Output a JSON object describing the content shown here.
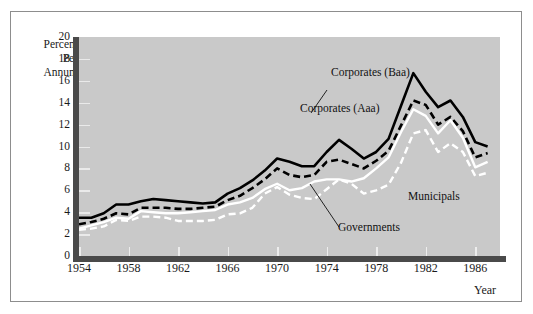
{
  "figure": {
    "background": "#ffffff",
    "plot_background": "#c9c9c9",
    "axis_color": "#4a4a4a",
    "frame_color": "#8d8d8d"
  },
  "axis_title_lines": [
    "Percent",
    "Per",
    "Annum"
  ],
  "xaxis_title": "Year",
  "annotations": {
    "corporates_baa": "Corporates (Baa)",
    "corporates_aaa": "Corporates (Aaa)",
    "municipals": "Municipals",
    "governments": "Governments"
  },
  "chart_data": {
    "type": "line",
    "title": "",
    "xlabel": "Year",
    "ylabel": "Percent Per Annum",
    "xlim": [
      1954,
      1988
    ],
    "ylim": [
      0,
      20
    ],
    "ytick_step": 2,
    "yticks": [
      0,
      2,
      4,
      6,
      8,
      10,
      12,
      14,
      16,
      18,
      20
    ],
    "xticks": [
      1954,
      1958,
      1962,
      1966,
      1970,
      1974,
      1978,
      1982,
      1986
    ],
    "grid": true,
    "legend_position": "inline-annotations",
    "x": [
      1954,
      1955,
      1956,
      1957,
      1958,
      1959,
      1960,
      1961,
      1962,
      1963,
      1964,
      1965,
      1966,
      1967,
      1968,
      1969,
      1970,
      1971,
      1972,
      1973,
      1974,
      1975,
      1976,
      1977,
      1978,
      1979,
      1980,
      1981,
      1982,
      1983,
      1984,
      1985,
      1986,
      1987
    ],
    "series": [
      {
        "name": "Corporates (Baa)",
        "style": "solid",
        "color": "#000000",
        "values": [
          3.5,
          3.5,
          3.9,
          4.7,
          4.7,
          5.0,
          5.2,
          5.1,
          5.0,
          4.9,
          4.8,
          4.9,
          5.7,
          6.2,
          6.9,
          7.8,
          8.9,
          8.6,
          8.2,
          8.2,
          9.5,
          10.6,
          9.8,
          8.9,
          9.5,
          10.7,
          13.7,
          16.7,
          15.0,
          13.6,
          14.2,
          12.7,
          10.4,
          10.0
        ]
      },
      {
        "name": "Corporates (Aaa)",
        "style": "dashed",
        "color": "#000000",
        "values": [
          2.9,
          3.1,
          3.4,
          3.9,
          3.8,
          4.4,
          4.4,
          4.4,
          4.3,
          4.3,
          4.4,
          4.5,
          5.1,
          5.5,
          6.2,
          7.0,
          8.0,
          7.4,
          7.2,
          7.4,
          8.6,
          8.8,
          8.4,
          8.0,
          8.7,
          9.6,
          11.9,
          14.2,
          13.8,
          12.0,
          12.7,
          11.4,
          9.0,
          9.4
        ]
      },
      {
        "name": "Governments",
        "style": "solid",
        "color": "#ffffff",
        "values": [
          2.5,
          2.8,
          3.1,
          3.5,
          3.4,
          4.1,
          4.0,
          3.9,
          3.9,
          4.0,
          4.1,
          4.2,
          4.7,
          4.9,
          5.3,
          6.1,
          6.6,
          6.0,
          6.2,
          6.8,
          7.0,
          7.0,
          6.8,
          7.1,
          8.0,
          9.0,
          11.3,
          13.4,
          12.8,
          11.2,
          12.4,
          10.8,
          8.1,
          8.6
        ]
      },
      {
        "name": "Municipals",
        "style": "dashed",
        "color": "#ffffff",
        "values": [
          2.4,
          2.5,
          2.7,
          3.3,
          3.2,
          3.6,
          3.6,
          3.5,
          3.2,
          3.2,
          3.2,
          3.3,
          3.8,
          3.9,
          4.4,
          5.7,
          6.3,
          5.6,
          5.3,
          5.2,
          6.1,
          7.0,
          6.6,
          5.7,
          6.0,
          6.5,
          8.5,
          11.2,
          11.5,
          9.5,
          10.3,
          9.5,
          7.3,
          7.6
        ]
      }
    ]
  }
}
